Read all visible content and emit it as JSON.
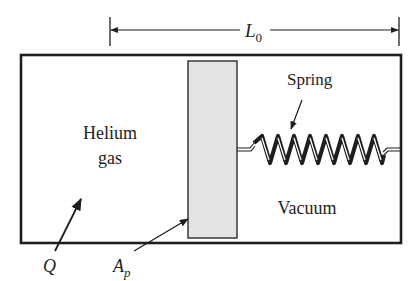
{
  "figure": {
    "type": "piston-cylinder schematic",
    "colors": {
      "line": "#1e1e1e",
      "piston_fill": "#e4e4e4",
      "background": "#ffffff"
    }
  },
  "dimension": {
    "label_main": "L",
    "label_sub": "0",
    "description": "initial length from piston face to end wall"
  },
  "regions": {
    "left_line1": "Helium",
    "left_line2": "gas",
    "right": "Vacuum"
  },
  "components": {
    "spring_label": "Spring",
    "spring_coils": 8
  },
  "annotations": {
    "heat": "Q",
    "area_main": "A",
    "area_sub": "p"
  }
}
